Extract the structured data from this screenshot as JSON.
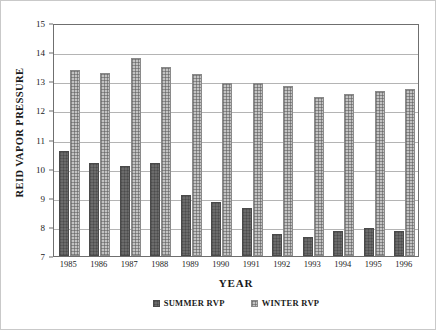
{
  "chart_data": {
    "type": "bar",
    "title": "",
    "xlabel": "YEAR",
    "ylabel": "REID VAPOR PRESSURE",
    "categories": [
      "1985",
      "1986",
      "1987",
      "1988",
      "1989",
      "1990",
      "1991",
      "1992",
      "1993",
      "1994",
      "1995",
      "1996"
    ],
    "series": [
      {
        "name": "SUMMER RVP",
        "color": "#6b6b6b",
        "values": [
          10.6,
          10.2,
          10.1,
          10.2,
          9.1,
          8.85,
          8.65,
          7.75,
          7.65,
          7.85,
          7.95,
          7.85
        ]
      },
      {
        "name": "WINTER RVP",
        "color": "#c3c3c3",
        "values": [
          13.4,
          13.3,
          13.8,
          13.5,
          13.25,
          12.95,
          12.95,
          12.85,
          12.45,
          12.55,
          12.65,
          12.75
        ]
      }
    ],
    "ylim": [
      7,
      15
    ],
    "yticks": [
      7,
      8,
      9,
      10,
      11,
      12,
      13,
      14,
      15
    ],
    "ytick_labels": [
      "7",
      "8",
      "9",
      "10",
      "11",
      "12",
      "13",
      "14",
      "15"
    ],
    "grid": true,
    "legend_position": "bottom"
  }
}
